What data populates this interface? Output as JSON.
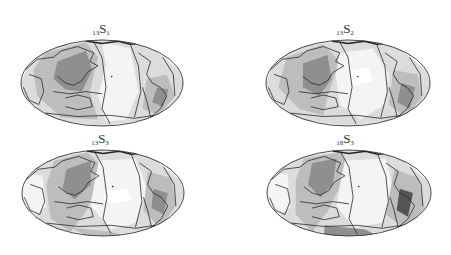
{
  "figure": {
    "panels": [
      {
        "id": "13S1",
        "prefix": "13",
        "letter": "S",
        "suffix": "1",
        "cx": 102,
        "cy": 83,
        "rx": 81,
        "ry": 43,
        "label_x": 101,
        "label_y": 22,
        "pattern": "s1"
      },
      {
        "id": "13S2",
        "prefix": "13",
        "letter": "S",
        "suffix": "2",
        "cx": 348,
        "cy": 83,
        "rx": 82,
        "ry": 43,
        "label_x": 345,
        "label_y": 22,
        "pattern": "s2"
      },
      {
        "id": "13S3",
        "prefix": "13",
        "letter": "S",
        "suffix": "3",
        "cx": 103,
        "cy": 193,
        "rx": 81,
        "ry": 43,
        "label_x": 100,
        "label_y": 132,
        "pattern": "s3"
      },
      {
        "id": "18S3",
        "prefix": "18",
        "letter": "S",
        "suffix": "3",
        "cx": 349,
        "cy": 193,
        "rx": 82,
        "ry": 43,
        "label_x": 345,
        "label_y": 132,
        "pattern": "s3b"
      }
    ],
    "colors": {
      "background": "#ffffff",
      "outline": "#333333",
      "lightest": "#f4f4f4",
      "light": "#dcdcdc",
      "mid": "#bdbdbd",
      "dark": "#8f8f8f",
      "darkest": "#555555"
    }
  }
}
